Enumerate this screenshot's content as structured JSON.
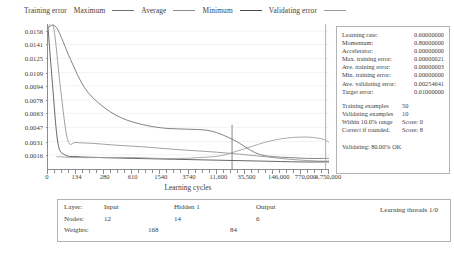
{
  "legend": {
    "title": "Training error",
    "items": [
      {
        "label": "Maximum",
        "color": "#6e6e6e"
      },
      {
        "label": "Average",
        "color": "#8f8f8f"
      },
      {
        "label": "Minimum",
        "color": "#4a4a4a"
      },
      {
        "label": "Validating error",
        "color": "#9b9b9b"
      }
    ]
  },
  "chart_data": {
    "type": "line",
    "title": "",
    "xlabel": "Learning cycles",
    "ylabel": "",
    "grid": true,
    "legend_position": "top",
    "x_tick_labels": [
      "0",
      "134",
      "280",
      "610",
      "1540",
      "3740",
      "11,600",
      "35,500",
      "146,000",
      "770,000",
      "4,750,000"
    ],
    "x_scale": "log-like-categorical",
    "y_tick_labels": [
      "0.0156",
      "0.0141",
      "0.0125",
      "0.0109",
      "0.0094",
      "0.0078",
      "0.0063",
      "0.0047",
      "0.0031",
      "0.0016"
    ],
    "y_values": [
      0.0156,
      0.0141,
      0.0125,
      0.0109,
      0.0094,
      0.0078,
      0.0063,
      0.0047,
      0.0031,
      0.0016
    ],
    "ylim": [
      0.0,
      0.0164
    ],
    "series": [
      {
        "name": "Maximum",
        "color": "#6e6e6e",
        "x": [
          0.0,
          0.3,
          0.8,
          1.3,
          1.9,
          2.6,
          3.4,
          4.2,
          5.0,
          5.8,
          6.6,
          7.4,
          8.0,
          8.6,
          9.2,
          9.8,
          10.0
        ],
        "values": [
          0.016,
          0.016,
          0.0124,
          0.0092,
          0.0072,
          0.0058,
          0.005,
          0.0046,
          0.0045,
          0.0043,
          0.0033,
          0.0018,
          0.0014,
          0.0013,
          0.0012,
          0.0012,
          0.0012
        ]
      },
      {
        "name": "Average",
        "color": "#8f8f8f",
        "x": [
          0.0,
          0.2,
          0.45,
          0.7,
          1.0,
          1.6,
          2.4,
          3.4,
          4.6,
          6.0,
          7.4,
          8.6,
          9.6,
          10.0
        ],
        "values": [
          0.016,
          0.016,
          0.009,
          0.0033,
          0.003,
          0.0029,
          0.0027,
          0.0025,
          0.0022,
          0.0019,
          0.0015,
          0.0011,
          0.0009,
          0.0009
        ]
      },
      {
        "name": "Minimum",
        "color": "#4a4a4a",
        "x": [
          0.0,
          0.15,
          0.35,
          0.6,
          1.0,
          1.8,
          3.0,
          4.5,
          6.0,
          7.5,
          9.0,
          10.0
        ],
        "values": [
          0.016,
          0.01,
          0.003,
          0.0016,
          0.0014,
          0.0013,
          0.0012,
          0.0011,
          0.001,
          0.0009,
          0.0008,
          0.0008
        ]
      },
      {
        "name": "Validating error",
        "color": "#9b9b9b",
        "x": [
          0.3,
          1.0,
          2.0,
          3.0,
          4.0,
          4.8,
          5.4,
          5.9,
          6.3,
          6.6,
          6.9,
          7.3,
          7.7,
          8.1,
          8.5,
          8.9,
          9.3,
          9.6,
          9.85,
          10.0
        ],
        "values": [
          0.0014,
          0.0013,
          0.0013,
          0.0013,
          0.0012,
          0.0012,
          0.0013,
          0.0014,
          0.0016,
          0.0019,
          0.0022,
          0.0026,
          0.003,
          0.0033,
          0.0035,
          0.0036,
          0.0036,
          0.0035,
          0.0033,
          0.003
        ]
      }
    ],
    "annotations": [
      {
        "type": "vertical-spike",
        "x": 6.55,
        "y_top": 0.005,
        "color": "#7a7a7a"
      },
      {
        "type": "vertical-spike",
        "x": 9.88,
        "y_top": 0.0164,
        "color": "#a8a8a8"
      }
    ]
  },
  "info_panel": {
    "parameters": [
      {
        "key": "Learning rate:",
        "value": "0.60000000"
      },
      {
        "key": "Momentum:",
        "value": "0.80000000"
      },
      {
        "key": "Accelerator:",
        "value": "0.00000000"
      },
      {
        "key": "Max. training error:",
        "value": "0.00000021"
      },
      {
        "key": "Ave. training error:",
        "value": "0.00000003"
      },
      {
        "key": "Min. training error:",
        "value": "0.00000000"
      },
      {
        "key": "Ave. validating error:",
        "value": "0.00254641"
      },
      {
        "key": "Target error:",
        "value": "0.01000000"
      }
    ],
    "stats": [
      {
        "key": "Training examples",
        "value": "50"
      },
      {
        "key": "Validating examples",
        "value": "10"
      },
      {
        "key": "Within 10.0% range",
        "value": "Score: 0"
      },
      {
        "key": "Correct if rounded.",
        "value": "Score: 8"
      }
    ],
    "status": "Validating: 80.00% OK"
  },
  "network_table": {
    "row_labels": [
      "Layer:",
      "Nodes:",
      "Weights:"
    ],
    "layers": [
      "Input",
      "Hidden 1",
      "Output"
    ],
    "nodes": [
      "12",
      "14",
      "6"
    ],
    "weights": [
      "168",
      "84"
    ],
    "threads": "Learning threads 1/0"
  }
}
